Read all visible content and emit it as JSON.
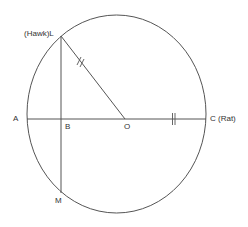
{
  "diagram": {
    "labels": {
      "L": "(Hawk)L",
      "A": "A",
      "B": "B",
      "O": "O",
      "C": "C (Rat)",
      "M": "M"
    },
    "stroke_color": "#555555",
    "text_color": "#333333"
  }
}
